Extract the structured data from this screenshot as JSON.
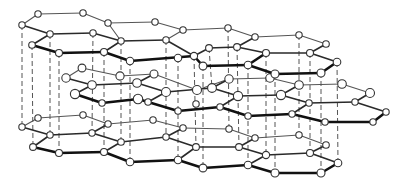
{
  "figure": {
    "title": "Graphite crystal structure: stacked hexagonal carbon layers",
    "colors": {
      "background": "#ffffff",
      "bond": "#2a2a2a",
      "atom_fill": "#ffffff",
      "atom_stroke": "#333333",
      "interlayer_line": "#555555"
    }
  },
  "layers": [
    {
      "name": "top-layer",
      "atoms": [
        [
          38,
          14
        ],
        [
          83,
          13
        ],
        [
          108,
          23
        ],
        [
          22,
          25
        ],
        [
          50,
          34
        ],
        [
          93,
          33
        ],
        [
          121,
          41
        ],
        [
          32,
          45
        ],
        [
          59,
          53
        ],
        [
          104,
          52
        ],
        [
          130,
          61
        ],
        [
          155,
          22
        ],
        [
          183,
          30
        ],
        [
          166,
          40
        ],
        [
          194,
          56
        ],
        [
          178,
          58
        ],
        [
          209,
          48
        ],
        [
          237,
          47
        ],
        [
          228,
          28
        ],
        [
          255,
          37
        ],
        [
          266,
          53
        ],
        [
          248,
          65
        ],
        [
          203,
          66
        ],
        [
          299,
          35
        ],
        [
          326,
          44
        ],
        [
          310,
          53
        ],
        [
          337,
          62
        ],
        [
          321,
          73
        ],
        [
          275,
          74
        ]
      ],
      "bonds": [
        [
          0,
          1,
          "back"
        ],
        [
          1,
          2,
          "back"
        ],
        [
          0,
          3,
          "back"
        ],
        [
          3,
          4,
          "mid"
        ],
        [
          4,
          5,
          "mid"
        ],
        [
          5,
          6,
          "mid"
        ],
        [
          2,
          6,
          "back"
        ],
        [
          4,
          7,
          "mid"
        ],
        [
          7,
          8,
          "front"
        ],
        [
          8,
          9,
          "front"
        ],
        [
          9,
          6,
          "mid"
        ],
        [
          9,
          10,
          "front"
        ],
        [
          2,
          11,
          "back"
        ],
        [
          11,
          12,
          "back"
        ],
        [
          12,
          13,
          "back"
        ],
        [
          6,
          13,
          "mid"
        ],
        [
          13,
          14,
          "mid"
        ],
        [
          10,
          14,
          "front"
        ],
        [
          12,
          18,
          "back"
        ],
        [
          18,
          19,
          "back"
        ],
        [
          19,
          17,
          "mid"
        ],
        [
          17,
          16,
          "mid"
        ],
        [
          16,
          14,
          "mid"
        ],
        [
          14,
          22,
          "front"
        ],
        [
          22,
          21,
          "front"
        ],
        [
          21,
          20,
          "front"
        ],
        [
          20,
          17,
          "mid"
        ],
        [
          19,
          23,
          "back"
        ],
        [
          23,
          24,
          "back"
        ],
        [
          24,
          25,
          "mid"
        ],
        [
          25,
          20,
          "mid"
        ],
        [
          25,
          26,
          "mid"
        ],
        [
          26,
          27,
          "front"
        ],
        [
          27,
          28,
          "front"
        ],
        [
          28,
          21,
          "front"
        ]
      ]
    },
    {
      "name": "middle-layer",
      "atoms": [
        [
          82,
          68
        ],
        [
          66,
          78
        ],
        [
          92,
          85
        ],
        [
          75,
          94
        ],
        [
          102,
          103
        ],
        [
          138,
          99
        ],
        [
          120,
          76
        ],
        [
          154,
          74
        ],
        [
          137,
          83
        ],
        [
          166,
          92
        ],
        [
          148,
          102
        ],
        [
          178,
          111
        ],
        [
          197,
          90
        ],
        [
          229,
          79
        ],
        [
          212,
          88
        ],
        [
          238,
          96
        ],
        [
          220,
          107
        ],
        [
          248,
          116
        ],
        [
          270,
          78
        ],
        [
          299,
          85
        ],
        [
          281,
          95
        ],
        [
          309,
          103
        ],
        [
          292,
          114
        ],
        [
          325,
          122
        ],
        [
          342,
          84
        ],
        [
          370,
          93
        ],
        [
          355,
          102
        ],
        [
          386,
          112
        ],
        [
          373,
          122
        ],
        [
          196,
          104
        ]
      ],
      "bonds": [
        [
          0,
          1,
          "back"
        ],
        [
          1,
          2,
          "mid"
        ],
        [
          2,
          3,
          "mid"
        ],
        [
          3,
          4,
          "front"
        ],
        [
          4,
          5,
          "front"
        ],
        [
          0,
          6,
          "back"
        ],
        [
          6,
          7,
          "back"
        ],
        [
          7,
          8,
          "mid"
        ],
        [
          8,
          2,
          "mid"
        ],
        [
          8,
          9,
          "mid"
        ],
        [
          9,
          10,
          "mid"
        ],
        [
          10,
          5,
          "front"
        ],
        [
          10,
          11,
          "front"
        ],
        [
          7,
          12,
          "back"
        ],
        [
          12,
          13,
          "back"
        ],
        [
          13,
          14,
          "mid"
        ],
        [
          14,
          9,
          "mid"
        ],
        [
          14,
          15,
          "mid"
        ],
        [
          15,
          16,
          "mid"
        ],
        [
          16,
          11,
          "front"
        ],
        [
          16,
          17,
          "front"
        ],
        [
          13,
          18,
          "back"
        ],
        [
          18,
          19,
          "back"
        ],
        [
          19,
          20,
          "mid"
        ],
        [
          20,
          15,
          "mid"
        ],
        [
          20,
          21,
          "mid"
        ],
        [
          21,
          22,
          "mid"
        ],
        [
          22,
          17,
          "front"
        ],
        [
          22,
          23,
          "front"
        ],
        [
          19,
          24,
          "back"
        ],
        [
          24,
          25,
          "back"
        ],
        [
          25,
          26,
          "mid"
        ],
        [
          26,
          21,
          "mid"
        ],
        [
          26,
          27,
          "mid"
        ],
        [
          27,
          28,
          "front"
        ],
        [
          28,
          23,
          "front"
        ]
      ]
    },
    {
      "name": "bottom-layer",
      "atoms": [
        [
          38,
          118
        ],
        [
          83,
          115
        ],
        [
          22,
          127
        ],
        [
          50,
          135
        ],
        [
          33,
          147
        ],
        [
          59,
          153
        ],
        [
          108,
          124
        ],
        [
          92,
          133
        ],
        [
          121,
          142
        ],
        [
          104,
          152
        ],
        [
          130,
          162
        ],
        [
          153,
          120
        ],
        [
          183,
          128
        ],
        [
          166,
          137
        ],
        [
          196,
          147
        ],
        [
          178,
          160
        ],
        [
          203,
          168
        ],
        [
          229,
          129
        ],
        [
          255,
          138
        ],
        [
          239,
          147
        ],
        [
          266,
          155
        ],
        [
          248,
          165
        ],
        [
          275,
          173
        ],
        [
          299,
          135
        ],
        [
          326,
          145
        ],
        [
          310,
          153
        ],
        [
          338,
          163
        ],
        [
          321,
          173
        ]
      ],
      "bonds": [
        [
          0,
          1,
          "back"
        ],
        [
          0,
          2,
          "back"
        ],
        [
          2,
          3,
          "mid"
        ],
        [
          3,
          4,
          "mid"
        ],
        [
          4,
          5,
          "front"
        ],
        [
          1,
          6,
          "back"
        ],
        [
          6,
          7,
          "mid"
        ],
        [
          7,
          3,
          "mid"
        ],
        [
          7,
          8,
          "mid"
        ],
        [
          8,
          9,
          "mid"
        ],
        [
          9,
          5,
          "front"
        ],
        [
          9,
          10,
          "front"
        ],
        [
          6,
          11,
          "back"
        ],
        [
          11,
          12,
          "back"
        ],
        [
          12,
          13,
          "mid"
        ],
        [
          13,
          8,
          "mid"
        ],
        [
          13,
          14,
          "mid"
        ],
        [
          14,
          15,
          "mid"
        ],
        [
          15,
          10,
          "front"
        ],
        [
          15,
          16,
          "front"
        ],
        [
          12,
          17,
          "back"
        ],
        [
          17,
          18,
          "back"
        ],
        [
          18,
          19,
          "mid"
        ],
        [
          19,
          14,
          "mid"
        ],
        [
          19,
          20,
          "mid"
        ],
        [
          20,
          21,
          "mid"
        ],
        [
          21,
          16,
          "front"
        ],
        [
          21,
          22,
          "front"
        ],
        [
          18,
          23,
          "back"
        ],
        [
          23,
          24,
          "back"
        ],
        [
          24,
          25,
          "mid"
        ],
        [
          25,
          20,
          "mid"
        ],
        [
          25,
          26,
          "mid"
        ],
        [
          26,
          27,
          "front"
        ],
        [
          27,
          22,
          "front"
        ]
      ]
    }
  ],
  "interlayer_lines": [
    [
      32,
      45,
      33,
      147
    ],
    [
      59,
      53,
      59,
      153
    ],
    [
      104,
      52,
      104,
      152
    ],
    [
      130,
      61,
      130,
      162
    ],
    [
      121,
      41,
      121,
      142
    ],
    [
      178,
      58,
      178,
      160
    ],
    [
      203,
      66,
      203,
      168
    ],
    [
      248,
      65,
      248,
      165
    ],
    [
      275,
      74,
      275,
      173
    ],
    [
      166,
      40,
      166,
      137
    ],
    [
      194,
      56,
      196,
      147
    ],
    [
      237,
      47,
      239,
      147
    ],
    [
      266,
      53,
      266,
      155
    ],
    [
      321,
      73,
      321,
      173
    ],
    [
      337,
      62,
      338,
      163
    ],
    [
      310,
      53,
      310,
      153
    ],
    [
      22,
      25,
      22,
      127
    ],
    [
      50,
      34,
      50,
      135
    ],
    [
      93,
      33,
      92,
      133
    ],
    [
      209,
      48,
      212,
      88
    ],
    [
      228,
      28,
      229,
      129
    ],
    [
      299,
      35,
      299,
      135
    ]
  ]
}
